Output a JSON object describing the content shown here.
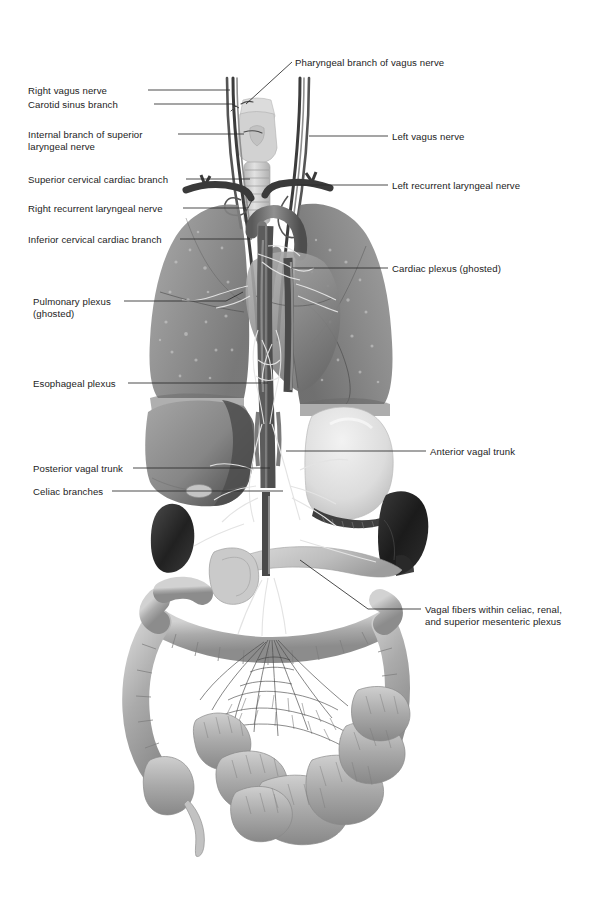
{
  "figure": {
    "type": "medical-anatomical-illustration",
    "style": "grayscale halftone airbrush rendering, ghosted lungs and heart",
    "width": 607,
    "height": 905,
    "background_color": "#ffffff",
    "ink_color": "#1c1c1c",
    "leader_line_color": "#2a2a2a"
  },
  "labels_left": [
    {
      "id": "right-vagus-nerve",
      "text": "Right vagus nerve",
      "x": 28,
      "y": 85,
      "line_from": 148,
      "line_to": 230,
      "line_y": 90,
      "tip_x": 232,
      "tip_y": 92
    },
    {
      "id": "carotid-sinus-branch",
      "text": "Carotid sinus branch",
      "x": 28,
      "y": 99,
      "line_from": 154,
      "line_to": 232,
      "line_y": 104,
      "tip_x": 236,
      "tip_y": 106
    },
    {
      "id": "internal-branch-superior-laryngeal-nerve",
      "text": "Internal branch of superior\nlaryngeal nerve",
      "x": 28,
      "y": 129,
      "line_from": 178,
      "line_to": 243,
      "line_y": 134,
      "tip_x": 246,
      "tip_y": 134
    },
    {
      "id": "superior-cervical-cardiac-branch",
      "text": "Superior cervical cardiac branch",
      "x": 28,
      "y": 174,
      "line_from": 186,
      "line_to": 248,
      "line_y": 179,
      "tip_x": 250,
      "tip_y": 181
    },
    {
      "id": "right-recurrent-laryngeal-nerve",
      "text": "Right recurrent laryngeal nerve",
      "x": 28,
      "y": 203,
      "line_from": 183,
      "line_to": 250,
      "line_y": 208,
      "tip_x": 252,
      "tip_y": 200
    },
    {
      "id": "inferior-cervical-cardiac-branch",
      "text": "Inferior cervical cardiac branch",
      "x": 28,
      "y": 234,
      "line_from": 180,
      "line_to": 250,
      "line_y": 239,
      "tip_x": 252,
      "tip_y": 239
    },
    {
      "id": "pulmonary-plexus-ghosted",
      "text": "Pulmonary plexus\n(ghosted)",
      "x": 33,
      "y": 296,
      "line_from": 124,
      "line_to": 225,
      "line_y": 301,
      "tip_x": 240,
      "tip_y": 292
    },
    {
      "id": "esophageal-plexus",
      "text": "Esophageal plexus",
      "x": 33,
      "y": 378,
      "line_from": 128,
      "line_to": 266,
      "line_y": 383,
      "tip_x": 268,
      "tip_y": 383
    },
    {
      "id": "posterior-vagal-trunk",
      "text": "Posterior vagal trunk",
      "x": 33,
      "y": 463,
      "line_from": 133,
      "line_to": 268,
      "line_y": 468,
      "tip_x": 270,
      "tip_y": 468
    },
    {
      "id": "celiac-branches",
      "text": "Celiac branches",
      "x": 33,
      "y": 486,
      "line_from": 112,
      "line_to": 280,
      "line_y": 491,
      "tip_x": 283,
      "tip_y": 491
    }
  ],
  "labels_right": [
    {
      "id": "pharyngeal-branch-of-vagus-nerve",
      "text": "Pharyngeal branch of vagus nerve",
      "x": 295,
      "y": 57,
      "line_from": 292,
      "line_to": 246,
      "line_y": 62,
      "tip_x": 243,
      "tip_y": 105
    },
    {
      "id": "left-vagus-nerve",
      "text": "Left vagus nerve",
      "x": 392,
      "y": 131,
      "line_from": 388,
      "line_to": 311,
      "line_y": 136,
      "tip_x": 309,
      "tip_y": 136
    },
    {
      "id": "left-recurrent-laryngeal-nerve",
      "text": "Left recurrent laryngeal nerve",
      "x": 392,
      "y": 180,
      "line_from": 388,
      "line_to": 300,
      "line_y": 185,
      "tip_x": 297,
      "tip_y": 185
    },
    {
      "id": "cardiac-plexus-ghosted",
      "text": "Cardiac plexus (ghosted)",
      "x": 392,
      "y": 263,
      "line_from": 388,
      "line_to": 293,
      "line_y": 268,
      "tip_x": 291,
      "tip_y": 268
    },
    {
      "id": "anterior-vagal-trunk",
      "text": "Anterior vagal trunk",
      "x": 430,
      "y": 446,
      "line_from": 426,
      "line_to": 288,
      "line_y": 451,
      "tip_x": 286,
      "tip_y": 451
    },
    {
      "id": "vagal-fibers-celiac-renal-sma",
      "text": "Vagal fibers within celiac, renal,\nand superior mesenteric plexus",
      "x": 425,
      "y": 604,
      "line_from": 421,
      "line_to": 368,
      "line_y": 609,
      "tip_x": 300,
      "tip_y": 560
    }
  ],
  "anatomy": {
    "structures": [
      {
        "name": "larynx-thyroid-cartilage",
        "tone": "#d8d8d8"
      },
      {
        "name": "trachea",
        "tone": "#cfcfcf"
      },
      {
        "name": "right-lung-ghosted",
        "tone": "#8b8b8b"
      },
      {
        "name": "left-lung-ghosted",
        "tone": "#848484"
      },
      {
        "name": "heart-ghosted",
        "tone": "#9a9a9a"
      },
      {
        "name": "aorta-great-vessels",
        "tone": "#6f6f6f"
      },
      {
        "name": "esophagus",
        "tone": "#7a7a7a"
      },
      {
        "name": "diaphragm-crura",
        "tone": "#6a6a6a"
      },
      {
        "name": "liver",
        "tone": "#8e8e8e"
      },
      {
        "name": "gallbladder",
        "tone": "#b5b5b5"
      },
      {
        "name": "stomach",
        "tone": "#dcdcdc"
      },
      {
        "name": "spleen",
        "tone": "#222222"
      },
      {
        "name": "right-kidney",
        "tone": "#2b2b2b"
      },
      {
        "name": "pancreas",
        "tone": "#c9c9c9"
      },
      {
        "name": "duodenum",
        "tone": "#c4c4c4"
      },
      {
        "name": "transverse-colon",
        "tone": "#b0b0b0"
      },
      {
        "name": "ascending-colon",
        "tone": "#aaaaaa"
      },
      {
        "name": "descending-colon",
        "tone": "#a6a6a6"
      },
      {
        "name": "cecum",
        "tone": "#b2b2b2"
      },
      {
        "name": "appendix",
        "tone": "#bdbdbd"
      },
      {
        "name": "small-intestine-jejunum-ileum",
        "tone": "#a8a8a8"
      },
      {
        "name": "mesentery-vessels",
        "tone": "#7d7d7d"
      },
      {
        "name": "vagal-nerve-fibers",
        "tone": "#e8e8e8"
      }
    ]
  }
}
